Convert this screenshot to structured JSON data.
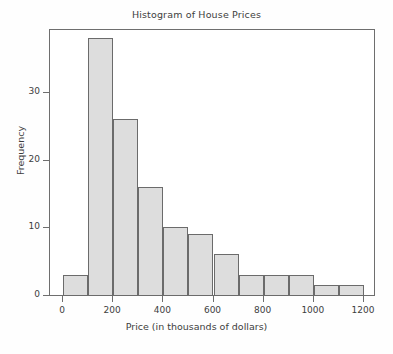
{
  "chart_data": {
    "type": "bar",
    "title": "Histogram of House Prices",
    "xlabel": "Price (in thousands of dollars)",
    "ylabel": "Frequency",
    "grid": false,
    "legend": null,
    "xlim": [
      0,
      1200
    ],
    "ylim": [
      0,
      39
    ],
    "bin_width": 100,
    "xticks": [
      0,
      200,
      400,
      600,
      800,
      1000,
      1200
    ],
    "xtick_labels": [
      "0",
      "200",
      "400",
      "600",
      "800",
      "1000",
      "1200"
    ],
    "yticks": [
      0,
      10,
      20,
      30
    ],
    "ytick_labels": [
      "0",
      "10",
      "20",
      "30"
    ],
    "bin_edges": [
      0,
      100,
      200,
      300,
      400,
      500,
      600,
      700,
      800,
      900,
      1000,
      1100,
      1200
    ],
    "categories": [
      "0-100",
      "100-200",
      "200-300",
      "300-400",
      "400-500",
      "500-600",
      "600-700",
      "700-800",
      "800-900",
      "900-1000",
      "1000-1100",
      "1100-1200"
    ],
    "values": [
      3,
      38,
      26,
      16,
      10,
      9,
      6,
      3,
      3,
      3,
      1.5,
      1.5
    ],
    "bar_fill_color": "#dddddd",
    "bar_edge_color": "#6b6b6b",
    "frame_color": "#6e6e6e",
    "background_color": "#ffffff"
  }
}
